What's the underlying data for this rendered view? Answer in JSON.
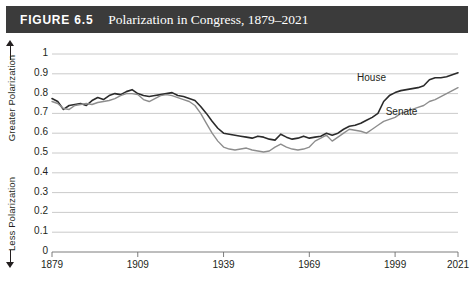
{
  "header": {
    "figure_number": "FIGURE 6.5",
    "title": "Polarization in Congress, 1879–2021",
    "bar_color": "#3b3b3b",
    "text_color": "#ffffff"
  },
  "axis_titles": {
    "greater": "Greater Polarization",
    "less": "Less Polarization"
  },
  "chart_data": {
    "type": "line",
    "title": "Polarization in Congress, 1879–2021",
    "subtitle": "",
    "xlabel": "",
    "ylabel": "Polarization",
    "xlim": [
      1879,
      2021
    ],
    "ylim": [
      0,
      1
    ],
    "grid": true,
    "grid_axis": "y",
    "legend": "inline-annotation",
    "ytick_labels": [
      "0",
      "0.1",
      "0.2",
      "0.3",
      "0.4",
      "0.5",
      "0.6",
      "0.7",
      "0.8",
      "0.9",
      "1"
    ],
    "ytick_values": [
      0,
      0.1,
      0.2,
      0.3,
      0.4,
      0.5,
      0.6,
      0.7,
      0.8,
      0.9,
      1
    ],
    "xtick_labels": [
      "1879",
      "1909",
      "1939",
      "1969",
      "1999",
      "2021"
    ],
    "xtick_values": [
      1879,
      1909,
      1939,
      1969,
      1999,
      2021
    ],
    "annotations": [
      {
        "text": "House",
        "x": 1992,
        "y": 0.875
      },
      {
        "text": "Senate",
        "x": 2002,
        "y": 0.7
      }
    ],
    "series": [
      {
        "name": "House",
        "color": "#2b2b2b",
        "width": 1.6,
        "x": [
          1879,
          1881,
          1883,
          1885,
          1887,
          1889,
          1891,
          1893,
          1895,
          1897,
          1899,
          1901,
          1903,
          1905,
          1907,
          1909,
          1911,
          1913,
          1915,
          1917,
          1919,
          1921,
          1923,
          1925,
          1927,
          1929,
          1931,
          1933,
          1935,
          1937,
          1939,
          1941,
          1943,
          1945,
          1947,
          1949,
          1951,
          1953,
          1955,
          1957,
          1959,
          1961,
          1963,
          1965,
          1967,
          1969,
          1971,
          1973,
          1975,
          1977,
          1979,
          1981,
          1983,
          1985,
          1987,
          1989,
          1991,
          1993,
          1995,
          1997,
          1999,
          2001,
          2003,
          2005,
          2007,
          2009,
          2011,
          2013,
          2015,
          2017,
          2019,
          2021
        ],
        "y": [
          0.775,
          0.76,
          0.72,
          0.74,
          0.745,
          0.75,
          0.74,
          0.765,
          0.78,
          0.77,
          0.79,
          0.8,
          0.795,
          0.81,
          0.82,
          0.8,
          0.79,
          0.785,
          0.79,
          0.795,
          0.8,
          0.805,
          0.79,
          0.785,
          0.775,
          0.765,
          0.735,
          0.7,
          0.66,
          0.625,
          0.6,
          0.595,
          0.59,
          0.585,
          0.58,
          0.575,
          0.585,
          0.58,
          0.57,
          0.565,
          0.595,
          0.58,
          0.57,
          0.575,
          0.585,
          0.575,
          0.58,
          0.585,
          0.6,
          0.59,
          0.6,
          0.62,
          0.635,
          0.64,
          0.65,
          0.665,
          0.68,
          0.7,
          0.76,
          0.79,
          0.805,
          0.815,
          0.82,
          0.825,
          0.83,
          0.84,
          0.87,
          0.88,
          0.88,
          0.885,
          0.895,
          0.905
        ]
      },
      {
        "name": "Senate",
        "color": "#8d8d8d",
        "width": 1.4,
        "x": [
          1879,
          1881,
          1883,
          1885,
          1887,
          1889,
          1891,
          1893,
          1895,
          1897,
          1899,
          1901,
          1903,
          1905,
          1907,
          1909,
          1911,
          1913,
          1915,
          1917,
          1919,
          1921,
          1923,
          1925,
          1927,
          1929,
          1931,
          1933,
          1935,
          1937,
          1939,
          1941,
          1943,
          1945,
          1947,
          1949,
          1951,
          1953,
          1955,
          1957,
          1959,
          1961,
          1963,
          1965,
          1967,
          1969,
          1971,
          1973,
          1975,
          1977,
          1979,
          1981,
          1983,
          1985,
          1987,
          1989,
          1991,
          1993,
          1995,
          1997,
          1999,
          2001,
          2003,
          2005,
          2007,
          2009,
          2011,
          2013,
          2015,
          2017,
          2019,
          2021
        ],
        "y": [
          0.76,
          0.75,
          0.725,
          0.72,
          0.74,
          0.745,
          0.75,
          0.745,
          0.755,
          0.76,
          0.765,
          0.775,
          0.79,
          0.8,
          0.8,
          0.795,
          0.77,
          0.76,
          0.775,
          0.79,
          0.795,
          0.79,
          0.78,
          0.77,
          0.76,
          0.74,
          0.7,
          0.65,
          0.6,
          0.56,
          0.53,
          0.52,
          0.515,
          0.52,
          0.525,
          0.515,
          0.51,
          0.505,
          0.51,
          0.53,
          0.545,
          0.53,
          0.52,
          0.515,
          0.52,
          0.53,
          0.56,
          0.575,
          0.59,
          0.56,
          0.58,
          0.6,
          0.62,
          0.615,
          0.61,
          0.6,
          0.62,
          0.64,
          0.66,
          0.67,
          0.68,
          0.7,
          0.71,
          0.72,
          0.73,
          0.74,
          0.76,
          0.77,
          0.785,
          0.8,
          0.815,
          0.83
        ]
      }
    ]
  }
}
